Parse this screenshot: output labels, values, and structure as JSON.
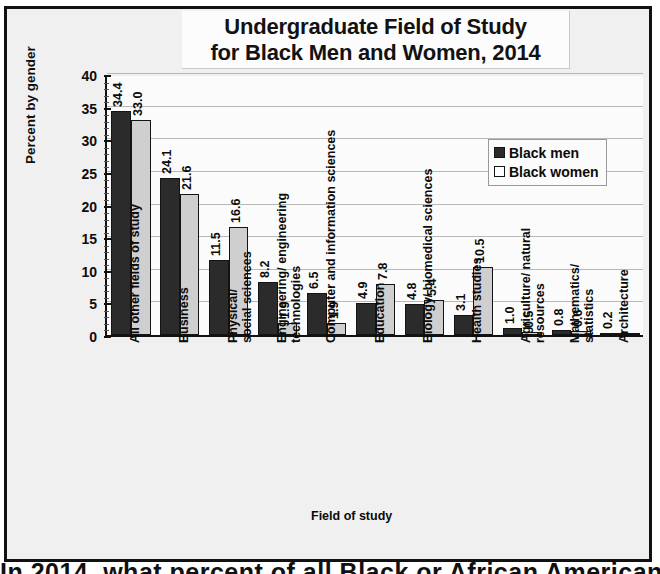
{
  "chart_data": {
    "type": "bar",
    "title": "Undergraduate Field of Study for Black Men and Women, 2014",
    "title_lines": [
      "Undergraduate Field of Study",
      "for Black Men and Women, 2014"
    ],
    "xlabel": "Field of study",
    "ylabel": "Percent by gender",
    "ylim": [
      0,
      40
    ],
    "yticks": [
      0,
      5,
      10,
      15,
      20,
      25,
      30,
      35,
      40
    ],
    "ytick_labels": [
      "0",
      "5",
      "10",
      "15",
      "20",
      "25",
      "30",
      "35",
      "40"
    ],
    "grid": true,
    "legend_position": "upper-right",
    "categories": [
      "All other fields of study",
      "Business",
      "Physical/\nsocial sciences",
      "Engineering/ engineering\ntechnologies",
      "Computer and information sciences",
      "Education",
      "Biology/ biomedical sciences",
      "Health studies",
      "Agriculture/ natural resources",
      "Mathematics/\nstatistics",
      "Architecture"
    ],
    "series": [
      {
        "name": "Black men",
        "color": "#2b2b2b",
        "values": [
          34.4,
          24.1,
          11.5,
          8.2,
          6.5,
          4.9,
          4.8,
          3.1,
          1.0,
          0.8,
          0.2
        ],
        "labels": [
          "34.4",
          "24.1",
          "11.5",
          "8.2",
          "6.5",
          "4.9",
          "4.8",
          "3.1",
          "1.0",
          "0.8",
          "0.2"
        ]
      },
      {
        "name": "Black women",
        "color": "#cfcfcf",
        "values": [
          33.0,
          21.6,
          16.6,
          1.9,
          1.9,
          7.8,
          5.4,
          10.5,
          0.5,
          0.6,
          0.1
        ],
        "labels": [
          "33.0",
          "21.6",
          "16.6",
          "1.9",
          "1.9",
          "7.8",
          "5.4",
          "10.5",
          "0.5",
          "0.6",
          ""
        ]
      }
    ]
  },
  "legend": {
    "items": [
      {
        "label": "Black men"
      },
      {
        "label": "Black women"
      }
    ]
  },
  "caption": {
    "text": "In 2014, what percent of all Black or African American"
  }
}
